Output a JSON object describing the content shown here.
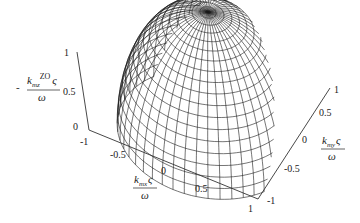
{
  "chart_data": {
    "type": "surface3d",
    "title": "",
    "surface": {
      "shape": "hemisphere",
      "radius": 1,
      "z_range": [
        0,
        1
      ],
      "mesh": "latitude-longitude wireframe",
      "parallels": 18,
      "meridians": 48,
      "color": "#1a1a1a"
    },
    "axes": {
      "x": {
        "label_num": "k_mx ς",
        "label_num_base": "k",
        "label_num_sub": "mx",
        "label_num_sym": "ς",
        "label_den": "ω",
        "ticks": [
          "-1",
          "-0.5",
          "0",
          "0.5",
          "1"
        ],
        "range": [
          -1,
          1
        ]
      },
      "y": {
        "label_num": "k_my ς",
        "label_num_base": "k",
        "label_num_sub": "my",
        "label_num_sym": "ς",
        "label_den": "ω",
        "ticks": [
          "-1",
          "-0.5",
          "0",
          "0.5",
          "1"
        ],
        "range": [
          -1,
          1
        ]
      },
      "z": {
        "label_prefix": "-",
        "label_num": "k_mz^ZO ς",
        "label_num_base": "k",
        "label_num_sub": "mz",
        "label_num_sup": "ZO",
        "label_num_sym": "ς",
        "label_den": "ω",
        "ticks": [
          "0",
          "0.5",
          "1"
        ],
        "range": [
          0,
          1
        ]
      }
    },
    "grid": false,
    "legend": null
  }
}
